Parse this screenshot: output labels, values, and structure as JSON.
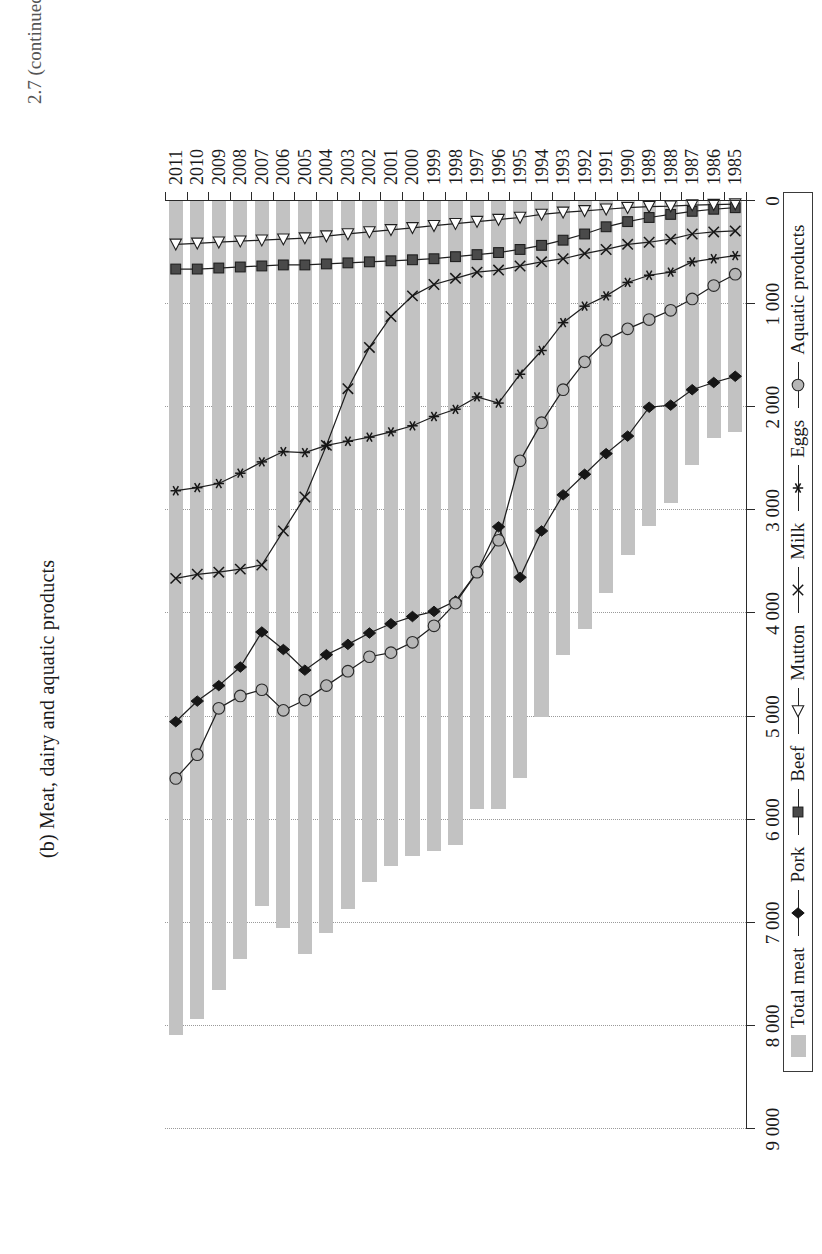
{
  "title": "(b) Meat, dairy and aquatic products",
  "caption": "2.7 (continued)",
  "legend": {
    "items": [
      {
        "label": "Total meat",
        "marker": "bar-swatch",
        "color": "#c2c2c2"
      },
      {
        "label": "Pork",
        "marker": "filled-diamond-marker",
        "color": "#161616"
      },
      {
        "label": "Beef",
        "marker": "filled-square-marker",
        "color": "#4a4a4a"
      },
      {
        "label": "Mutton",
        "marker": "open-triangle-marker",
        "color": "#ffffff"
      },
      {
        "label": "Milk",
        "marker": "cross-x-marker",
        "color": "#161616"
      },
      {
        "label": "Eggs",
        "marker": "asterisk-marker",
        "color": "#161616"
      },
      {
        "label": "Aquatic products",
        "marker": "grey-circle-marker",
        "color": "#9d9d9d"
      }
    ]
  },
  "axis": {
    "value_ticks": [
      "0",
      "1 000",
      "2 000",
      "3 000",
      "4 000",
      "5 000",
      "6 000",
      "7 000",
      "8 000",
      "9 000"
    ],
    "value_min": 0,
    "value_max": 9000,
    "value_step": 1000,
    "grid": true
  },
  "chart_data": {
    "type": "bar",
    "title": "(b) Meat, dairy and aquatic products",
    "xlabel": "",
    "ylabel": "",
    "ylim": [
      0,
      9000
    ],
    "grid": true,
    "legend_position": "bottom",
    "categories": [
      "1985",
      "1986",
      "1987",
      "1988",
      "1989",
      "1990",
      "1991",
      "1992",
      "1993",
      "1994",
      "1995",
      "1996",
      "1997",
      "1998",
      "1999",
      "2000",
      "2001",
      "2002",
      "2003",
      "2004",
      "2005",
      "2006",
      "2007",
      "2008",
      "2009",
      "2010",
      "2011"
    ],
    "series": [
      {
        "name": "Total meat",
        "type": "bar",
        "values": [
          2240,
          2300,
          2560,
          2930,
          3150,
          3430,
          3800,
          4150,
          4400,
          5000,
          5600,
          5900,
          5900,
          6250,
          6300,
          6350,
          6450,
          6600,
          6870,
          7100,
          7300,
          7050,
          6840,
          7350,
          7650,
          7930,
          8090
        ]
      },
      {
        "name": "Pork",
        "type": "line",
        "values": [
          1700,
          1760,
          1830,
          1980,
          2000,
          2280,
          2450,
          2650,
          2850,
          3200,
          3650,
          3160,
          3600,
          3880,
          3980,
          4030,
          4100,
          4190,
          4300,
          4400,
          4550,
          4350,
          4180,
          4520,
          4700,
          4850,
          5050
        ]
      },
      {
        "name": "Beef",
        "type": "line",
        "values": [
          65,
          80,
          100,
          130,
          160,
          200,
          250,
          320,
          380,
          430,
          470,
          500,
          520,
          540,
          560,
          570,
          580,
          590,
          600,
          610,
          620,
          620,
          630,
          640,
          650,
          660,
          660
        ]
      },
      {
        "name": "Mutton",
        "type": "line",
        "values": [
          30,
          35,
          40,
          50,
          55,
          65,
          80,
          95,
          110,
          130,
          160,
          180,
          200,
          220,
          240,
          260,
          280,
          300,
          320,
          340,
          360,
          370,
          380,
          390,
          400,
          410,
          420
        ]
      },
      {
        "name": "Milk",
        "type": "line",
        "values": [
          290,
          300,
          320,
          370,
          400,
          420,
          470,
          510,
          560,
          590,
          630,
          670,
          690,
          750,
          810,
          920,
          1120,
          1420,
          1820,
          2370,
          2870,
          3200,
          3530,
          3570,
          3600,
          3620,
          3660
        ]
      },
      {
        "name": "Eggs",
        "type": "line",
        "values": [
          530,
          560,
          590,
          690,
          720,
          790,
          920,
          1020,
          1180,
          1450,
          1680,
          1960,
          1900,
          2020,
          2090,
          2180,
          2240,
          2290,
          2330,
          2370,
          2440,
          2430,
          2530,
          2640,
          2740,
          2780,
          2810
        ]
      },
      {
        "name": "Aquatic products",
        "type": "line",
        "values": [
          710,
          820,
          950,
          1060,
          1150,
          1240,
          1350,
          1560,
          1830,
          2150,
          2520,
          3290,
          3600,
          3900,
          4120,
          4280,
          4380,
          4420,
          4560,
          4700,
          4840,
          4940,
          4740,
          4800,
          4920,
          5370,
          5600
        ]
      }
    ]
  }
}
